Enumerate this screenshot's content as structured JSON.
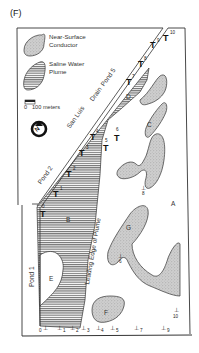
{
  "figure": {
    "panel_label": "(F)",
    "legend": {
      "items": [
        {
          "id": "near_surface_conductor",
          "label_line1": "Near-Surface",
          "label_line2": "Conductor",
          "fill": "stipple-gray"
        },
        {
          "id": "saline_water_plume",
          "label_line1": "Saline Water",
          "label_line2": "Plume",
          "fill": "horizontal-hatch"
        }
      ]
    },
    "scale_bar": {
      "zero": "0",
      "label": "100 meters"
    },
    "north_arrow": {
      "label": "N"
    },
    "features": {
      "drain": "San Luis Drain",
      "drain_part1": "San Luis",
      "drain_part2": "Drain",
      "ponds": [
        "Pond 1",
        "Pond 2",
        "Pond 5"
      ],
      "pond1": "Pond 1",
      "pond2": "Pond 2",
      "pond5": "Pond 5",
      "plume_edge": "Leading Edge of Plume",
      "plume_edge_1": "Leading",
      "plume_edge_2": "Edge",
      "plume_edge_3": "of",
      "plume_edge_4": "Plume"
    },
    "regions": {
      "A": "A",
      "B": "B",
      "C": "C",
      "D": "D",
      "E": "E",
      "F": "F",
      "G": "G"
    },
    "transects_T": [
      {
        "symbol": "T",
        "num": "0"
      },
      {
        "symbol": "T",
        "num": "1"
      },
      {
        "symbol": "T",
        "num": "2"
      },
      {
        "symbol": "T",
        "num": "3"
      },
      {
        "symbol": "T",
        "num": "4"
      },
      {
        "symbol": "T",
        "num": "5"
      },
      {
        "symbol": "T",
        "num": "6"
      },
      {
        "symbol": "T",
        "num": "7"
      },
      {
        "symbol": "T",
        "num": "8"
      },
      {
        "symbol": "T",
        "num": "9"
      },
      {
        "symbol": "T",
        "num": "10"
      }
    ],
    "mid_markers": [
      {
        "symbol": "⊥",
        "num": "8"
      },
      {
        "symbol": "⊥",
        "num": "6"
      },
      {
        "symbol": "⊥",
        "num": "10"
      }
    ],
    "bottom_markers": [
      {
        "symbol": "⊥",
        "num": "0"
      },
      {
        "symbol": "⊥",
        "num": "1"
      },
      {
        "symbol": "⊥",
        "num": "2"
      },
      {
        "symbol": "⊥",
        "num": "3"
      },
      {
        "symbol": "⊥",
        "num": "4"
      },
      {
        "symbol": "⊥",
        "num": "5"
      },
      {
        "symbol": "⊥",
        "num": "7"
      },
      {
        "symbol": "⊥",
        "num": "9"
      }
    ],
    "colors": {
      "ink": "#2a2a2a",
      "conductor_fill": "#c9c9c9",
      "hatch": "#555555",
      "paper": "#ffffff"
    }
  }
}
